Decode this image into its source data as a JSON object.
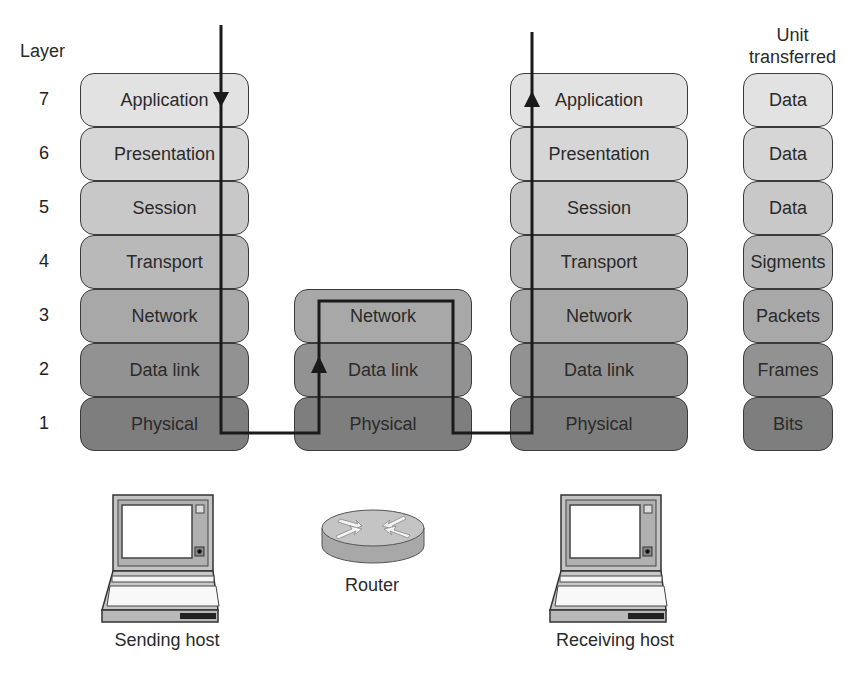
{
  "headers": {
    "layer": "Layer",
    "unit_line1": "Unit",
    "unit_line2": "transferred"
  },
  "layer_numbers": [
    "7",
    "6",
    "5",
    "4",
    "3",
    "2",
    "1"
  ],
  "sending_host": {
    "layers": [
      "Application",
      "Presentation",
      "Session",
      "Transport",
      "Network",
      "Data link",
      "Physical"
    ],
    "caption": "Sending host",
    "icon": "laptop-icon"
  },
  "router": {
    "layers": [
      "Network",
      "Data link",
      "Physical"
    ],
    "caption": "Router",
    "icon": "router-icon"
  },
  "receiving_host": {
    "layers": [
      "Application",
      "Presentation",
      "Session",
      "Transport",
      "Network",
      "Data link",
      "Physical"
    ],
    "caption": "Receiving host",
    "icon": "laptop-icon"
  },
  "units": [
    "Data",
    "Data",
    "Data",
    "Sigments",
    "Packets",
    "Frames",
    "Bits"
  ],
  "colors": {
    "layer7": "#e2e2e2",
    "layer6": "#d6d6d6",
    "layer5": "#c8c8c8",
    "layer4": "#b9b9b9",
    "layer3": "#a8a8a8",
    "layer2": "#929292",
    "layer1": "#7e7e7e",
    "border": "#3a3a3a",
    "path": "#1a1a1a"
  }
}
